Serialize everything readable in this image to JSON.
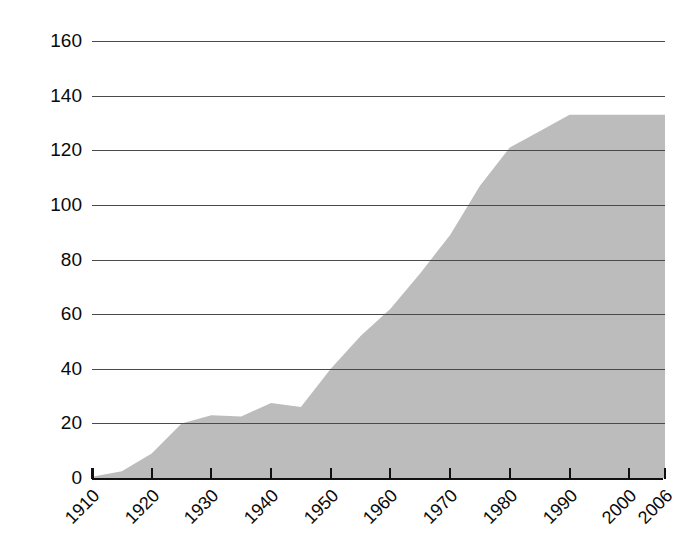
{
  "chart_data": {
    "type": "area",
    "title": "",
    "xlabel": "",
    "ylabel": "Millions of cars",
    "xlim": [
      1910,
      2006
    ],
    "ylim": [
      0,
      160
    ],
    "grid": true,
    "legend": false,
    "fill_color": "#bcbcbc",
    "grid_color": "#4a4a4a",
    "axis_color": "#111111",
    "x_tick_labels": [
      "1910",
      "1920",
      "1930",
      "1940",
      "1950",
      "1960",
      "1970",
      "1980",
      "1990",
      "2000",
      "2006"
    ],
    "x_tick_values": [
      1910,
      1920,
      1930,
      1940,
      1950,
      1960,
      1970,
      1980,
      1990,
      2000,
      2006
    ],
    "y_tick_labels": [
      "0",
      "20",
      "40",
      "60",
      "80",
      "100",
      "120",
      "140",
      "160"
    ],
    "y_tick_values": [
      0,
      20,
      40,
      60,
      80,
      100,
      120,
      140,
      160
    ],
    "x": [
      1910,
      1915,
      1920,
      1925,
      1930,
      1935,
      1940,
      1945,
      1950,
      1955,
      1960,
      1965,
      1970,
      1975,
      1980,
      1985,
      1990,
      1995,
      2000,
      2006
    ],
    "values": [
      0.5,
      2.5,
      9,
      20,
      23,
      22.5,
      27.5,
      26,
      40,
      52,
      62,
      75,
      89,
      107,
      121,
      127,
      133,
      133,
      133,
      133
    ],
    "series": [
      {
        "name": "Millions of cars",
        "values": [
          0.5,
          2.5,
          9,
          20,
          23,
          22.5,
          27.5,
          26,
          40,
          52,
          62,
          75,
          89,
          107,
          121,
          127,
          133,
          133,
          133,
          133
        ]
      }
    ]
  },
  "axis": {
    "y_title": "Millions of cars"
  }
}
